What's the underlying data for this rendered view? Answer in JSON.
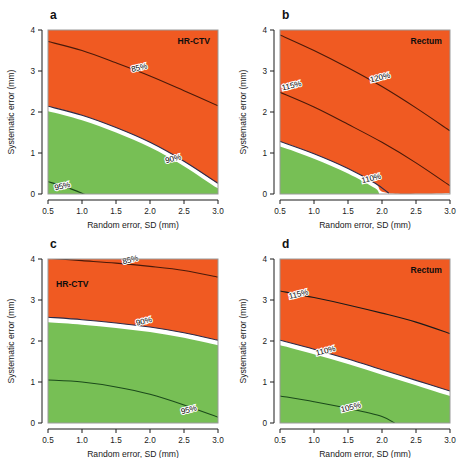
{
  "figure": {
    "background_color": "#ffffff",
    "layout": "2x2 grid of filled contour panels",
    "panels_order": [
      "a",
      "b",
      "c",
      "d"
    ]
  },
  "colors": {
    "orange": "#F05A22",
    "green": "#77BF55",
    "white_band": "#ffffff",
    "contour_line_dark": "#1a1a1a",
    "contour_line_navy": "#2b2b4a",
    "axis": "#1a1a1a",
    "frame": "#9a9a9a",
    "text": "#111111"
  },
  "axes": {
    "xlabel": "Random error, SD (mm)",
    "ylabel": "Systematic error (mm)",
    "xticks": [
      "0.5",
      "1.0",
      "1.5",
      "2.0",
      "2.5",
      "3.0"
    ],
    "xtick_values": [
      0.5,
      1.0,
      1.5,
      2.0,
      2.5,
      3.0
    ],
    "yticks": [
      "0",
      "1",
      "2",
      "3",
      "4"
    ],
    "ytick_values": [
      0,
      1,
      2,
      3,
      4
    ],
    "xlim": [
      0.5,
      3.0
    ],
    "ylim": [
      0,
      4
    ],
    "grid": false
  },
  "chart_data": {
    "type": "heatmap",
    "title": "",
    "xlabel": "Random error, SD (mm)",
    "ylabel": "Systematic error (mm)",
    "xlim": [
      0.5,
      3.0
    ],
    "ylim": [
      0,
      4
    ],
    "grid": false,
    "legend_position": "none",
    "colormap": {
      "green": "#77BF55",
      "white": "#ffffff",
      "orange": "#F05A22"
    },
    "panels": [
      {
        "letter": "a",
        "title": "HR-CTV",
        "title_position": "top-right",
        "letter_position": "top-left",
        "contours": [
          {
            "label": "85%",
            "label_x": 1.85,
            "label_y": 3.02,
            "color": "#4a1a0a",
            "points": [
              {
                "x": 0.5,
                "y": 3.72
              },
              {
                "x": 1.0,
                "y": 3.5
              },
              {
                "x": 1.5,
                "y": 3.2
              },
              {
                "x": 2.0,
                "y": 2.88
              },
              {
                "x": 2.5,
                "y": 2.52
              },
              {
                "x": 3.0,
                "y": 2.15
              }
            ]
          },
          {
            "label": "90%",
            "label_x": 2.35,
            "label_y": 0.8,
            "color": "#2b2b4a",
            "points": [
              {
                "x": 0.5,
                "y": 2.14
              },
              {
                "x": 1.0,
                "y": 1.92
              },
              {
                "x": 1.5,
                "y": 1.62
              },
              {
                "x": 2.0,
                "y": 1.26
              },
              {
                "x": 2.5,
                "y": 0.8
              },
              {
                "x": 3.0,
                "y": 0.26
              }
            ]
          },
          {
            "label": "95%",
            "label_x": 0.72,
            "label_y": 0.13,
            "color": "#1b4a1b",
            "points": [
              {
                "x": 0.5,
                "y": 0.3
              },
              {
                "x": 0.75,
                "y": 0.18
              },
              {
                "x": 1.0,
                "y": 0.02
              },
              {
                "x": 1.1,
                "y": -0.06
              }
            ]
          }
        ],
        "regions": [
          {
            "fill": "green",
            "description": "lower-left region below 90% band"
          },
          {
            "fill": "white",
            "description": "narrow band along 90% contour"
          },
          {
            "fill": "orange",
            "description": "upper region above 90% band"
          }
        ]
      },
      {
        "letter": "b",
        "title": "Rectum",
        "title_position": "top-right",
        "letter_position": "top-left",
        "contours": [
          {
            "label": "120%",
            "label_x": 1.98,
            "label_y": 2.78,
            "color": "#4a1a0a",
            "points": [
              {
                "x": 0.5,
                "y": 3.88
              },
              {
                "x": 1.0,
                "y": 3.5
              },
              {
                "x": 1.5,
                "y": 3.08
              },
              {
                "x": 2.0,
                "y": 2.62
              },
              {
                "x": 2.5,
                "y": 2.1
              },
              {
                "x": 3.0,
                "y": 1.54
              }
            ]
          },
          {
            "label": "115%",
            "label_x": 0.68,
            "label_y": 2.58,
            "color": "#4a1a0a",
            "points": [
              {
                "x": 0.5,
                "y": 2.48
              },
              {
                "x": 1.0,
                "y": 2.12
              },
              {
                "x": 1.5,
                "y": 1.7
              },
              {
                "x": 2.0,
                "y": 1.26
              },
              {
                "x": 2.5,
                "y": 0.76
              },
              {
                "x": 3.0,
                "y": 0.2
              }
            ]
          },
          {
            "label": "110%",
            "label_x": 1.85,
            "label_y": 0.32,
            "color": "#2b2b4a",
            "points": [
              {
                "x": 0.5,
                "y": 1.28
              },
              {
                "x": 1.0,
                "y": 0.98
              },
              {
                "x": 1.5,
                "y": 0.62
              },
              {
                "x": 1.9,
                "y": 0.26
              },
              {
                "x": 2.1,
                "y": 0.02
              }
            ]
          }
        ],
        "regions": [
          {
            "fill": "green",
            "description": "small lower-left wedge below 110%"
          },
          {
            "fill": "white",
            "description": "narrow band along 110% contour"
          },
          {
            "fill": "orange",
            "description": "remaining majority of panel"
          }
        ]
      },
      {
        "letter": "c",
        "title": "HR-CTV",
        "title_position": "upper-left inside plot",
        "letter_position": "top-left",
        "contours": [
          {
            "label": "85%",
            "label_x": 1.72,
            "label_y": 3.92,
            "color": "#4a1a0a",
            "points": [
              {
                "x": 0.5,
                "y": 4.02
              },
              {
                "x": 1.0,
                "y": 3.96
              },
              {
                "x": 1.5,
                "y": 3.9
              },
              {
                "x": 2.0,
                "y": 3.82
              },
              {
                "x": 2.5,
                "y": 3.72
              },
              {
                "x": 3.0,
                "y": 3.56
              }
            ]
          },
          {
            "label": "90%",
            "label_x": 1.92,
            "label_y": 2.42,
            "color": "#2b2b4a",
            "points": [
              {
                "x": 0.5,
                "y": 2.58
              },
              {
                "x": 1.0,
                "y": 2.52
              },
              {
                "x": 1.5,
                "y": 2.44
              },
              {
                "x": 2.0,
                "y": 2.34
              },
              {
                "x": 2.5,
                "y": 2.2
              },
              {
                "x": 3.0,
                "y": 2.02
              }
            ]
          },
          {
            "label": "95%",
            "label_x": 2.58,
            "label_y": 0.26,
            "color": "#1b4a1b",
            "points": [
              {
                "x": 0.5,
                "y": 1.05
              },
              {
                "x": 1.0,
                "y": 1.0
              },
              {
                "x": 1.5,
                "y": 0.88
              },
              {
                "x": 2.0,
                "y": 0.7
              },
              {
                "x": 2.5,
                "y": 0.44
              },
              {
                "x": 3.0,
                "y": 0.14
              }
            ]
          }
        ],
        "regions": [
          {
            "fill": "green",
            "description": "lower region below 90% band"
          },
          {
            "fill": "white",
            "description": "narrow band along 90% contour"
          },
          {
            "fill": "orange",
            "description": "upper region above 90% band"
          }
        ]
      },
      {
        "letter": "d",
        "title": "Rectum",
        "title_position": "top-right",
        "letter_position": "top-left",
        "contours": [
          {
            "label": "115%",
            "label_x": 0.78,
            "label_y": 3.08,
            "color": "#1a1a1a",
            "points": [
              {
                "x": 0.5,
                "y": 3.22
              },
              {
                "x": 1.0,
                "y": 3.06
              },
              {
                "x": 1.5,
                "y": 2.88
              },
              {
                "x": 2.0,
                "y": 2.68
              },
              {
                "x": 2.5,
                "y": 2.46
              },
              {
                "x": 3.0,
                "y": 2.18
              }
            ]
          },
          {
            "label": "110%",
            "label_x": 1.18,
            "label_y": 1.7,
            "color": "#2b2b4a",
            "points": [
              {
                "x": 0.5,
                "y": 2.02
              },
              {
                "x": 1.0,
                "y": 1.8
              },
              {
                "x": 1.5,
                "y": 1.56
              },
              {
                "x": 2.0,
                "y": 1.3
              },
              {
                "x": 2.5,
                "y": 1.04
              },
              {
                "x": 3.0,
                "y": 0.78
              }
            ]
          },
          {
            "label": "105%",
            "label_x": 1.55,
            "label_y": 0.32,
            "color": "#1b4a1b",
            "points": [
              {
                "x": 0.5,
                "y": 0.66
              },
              {
                "x": 1.0,
                "y": 0.52
              },
              {
                "x": 1.5,
                "y": 0.36
              },
              {
                "x": 2.0,
                "y": 0.16
              },
              {
                "x": 2.2,
                "y": -0.02
              }
            ]
          }
        ],
        "regions": [
          {
            "fill": "green",
            "description": "lower region below 110% band"
          },
          {
            "fill": "white",
            "description": "narrow band along 110% contour"
          },
          {
            "fill": "orange",
            "description": "upper region above 110% band"
          }
        ]
      }
    ]
  }
}
